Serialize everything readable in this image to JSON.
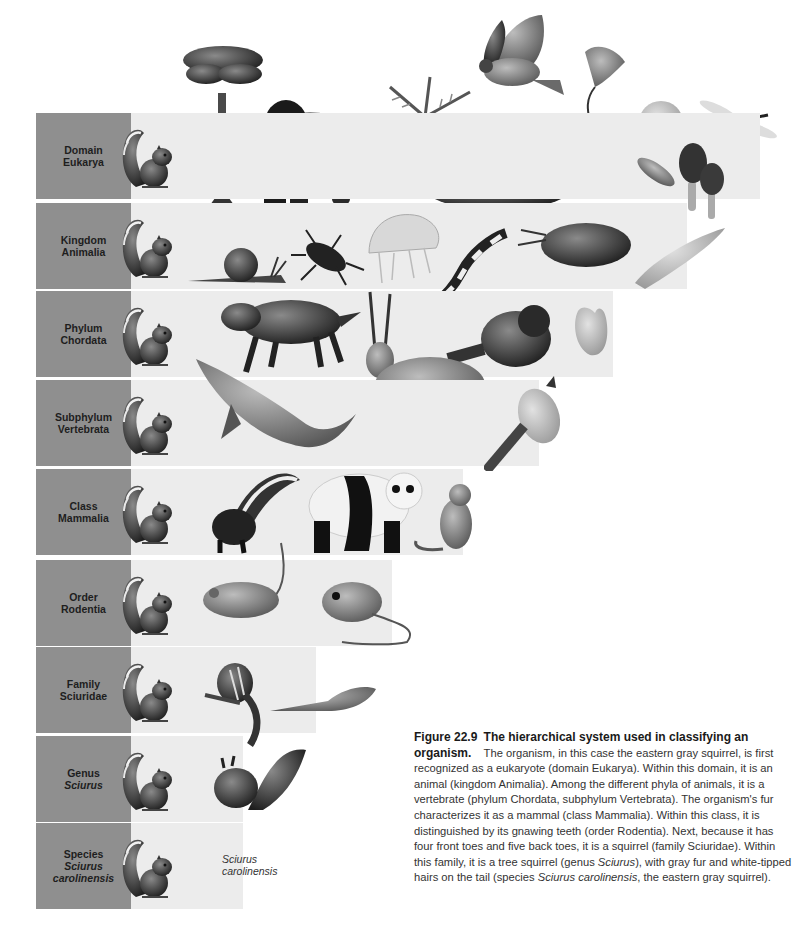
{
  "figure": {
    "number": "Figure 22.9",
    "title": "The hierarchical system used in classifying an organism.",
    "caption_parts": {
      "p1": "The organism, in this case the eastern gray squirrel, is first recognized as a eukaryote (domain Eukarya). Within this domain, it is an animal (kingdom Animalia). Among the different phyla of animals, it is a vertebrate (phylum Chordata, subphylum Vertebrata). The organism's fur characterizes it as a mammal (class Mammalia). Within this class, it is distinguished by its gnawing teeth (order Rodentia). Next, because it has four front toes and five back toes, it is a squirrel (family Sciuridae). Within this family, it is a tree squirrel (genus ",
      "genus_italic": "Sciurus",
      "p2": "), with gray fur and white-tipped hairs on the tail (species ",
      "species_italic": "Sciurus carolinensis",
      "p3": ", the eastern gray squirrel)."
    }
  },
  "colors": {
    "label_box": "#8f8f8f",
    "band_fill": "#ececec",
    "background": "#ffffff"
  },
  "levels": [
    {
      "rank": "Domain",
      "name": "Eukarya",
      "name_italic": false,
      "band_right": 760,
      "organisms": [
        "eastern-gray-squirrel",
        "tree",
        "gorilla",
        "fern",
        "moss",
        "hawk",
        "kelp",
        "protist-cell",
        "paramecium",
        "morel-mushroom",
        "dragonfly"
      ]
    },
    {
      "rank": "Kingdom",
      "name": "Animalia",
      "name_italic": false,
      "band_right": 687,
      "organisms": [
        "eastern-gray-squirrel",
        "snail",
        "beetle",
        "jellyfish",
        "salamander",
        "crayfish",
        "flatworm"
      ]
    },
    {
      "rank": "Phylum",
      "name": "Chordata",
      "name_italic": false,
      "band_right": 613,
      "organisms": [
        "eastern-gray-squirrel",
        "wolf",
        "oryx",
        "raccoon",
        "sea-squirt"
      ]
    },
    {
      "rank": "Subphylum",
      "name": "Vertebrata",
      "name_italic": false,
      "band_right": 539,
      "organisms": [
        "eastern-gray-squirrel",
        "humpback-whale",
        "warbler"
      ]
    },
    {
      "rank": "Class",
      "name": "Mammalia",
      "name_italic": false,
      "band_right": 463,
      "organisms": [
        "eastern-gray-squirrel",
        "skunk",
        "giant-panda",
        "monkey"
      ]
    },
    {
      "rank": "Order",
      "name": "Rodentia",
      "name_italic": false,
      "band_right": 392,
      "organisms": [
        "eastern-gray-squirrel",
        "mouse",
        "kangaroo-rat"
      ]
    },
    {
      "rank": "Family",
      "name": "Sciuridae",
      "name_italic": false,
      "band_right": 316,
      "organisms": [
        "eastern-gray-squirrel",
        "chipmunk",
        "flying-squirrel"
      ]
    },
    {
      "rank": "Genus",
      "name": "Sciurus",
      "name_italic": true,
      "band_right": 243,
      "organisms": [
        "eastern-gray-squirrel",
        "red-squirrel"
      ]
    },
    {
      "rank": "Species",
      "name": "Sciurus carolinensis",
      "name_line1": "Sciurus",
      "name_line2": "carolinensis",
      "name_italic": true,
      "band_right": 243,
      "organisms": [
        "eastern-gray-squirrel"
      ],
      "species_label_line1": "Sciurus",
      "species_label_line2": "carolinensis"
    }
  ]
}
